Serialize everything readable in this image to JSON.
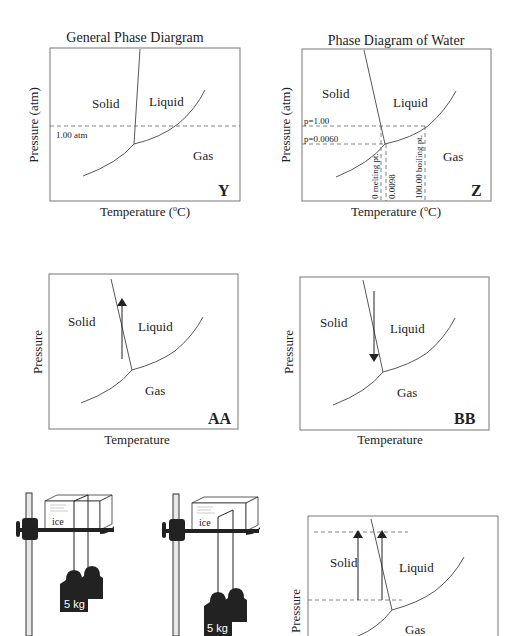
{
  "diagrams": {
    "y": {
      "title": "General Phase Diargram",
      "ylabel": "Pressure (atm)",
      "xlabel": "Temperature (",
      "xlabel_sup": "o",
      "xlabel_end": "C)",
      "regions": {
        "solid": "Solid",
        "liquid": "Liquid",
        "gas": "Gas"
      },
      "reference_line": "1.00 atm",
      "tag": "Y"
    },
    "z": {
      "title": "Phase Diagram of Water",
      "ylabel": "Pressure (atm)",
      "xlabel": "Temperature (",
      "xlabel_sup": "o",
      "xlabel_end": "C)",
      "regions": {
        "solid": "Solid",
        "liquid": "Liquid",
        "gas": "Gas"
      },
      "pressure_lines": [
        "p=1.00",
        "p=0.0060"
      ],
      "temperature_lines": [
        "0  melting pt.",
        "0.0098",
        "100.00  boiling pt."
      ],
      "tag": "Z"
    },
    "aa": {
      "ylabel": "Pressure",
      "xlabel": "Temperature",
      "regions": {
        "solid": "Solid",
        "liquid": "Liquid",
        "gas": "Gas"
      },
      "arrow_direction": "up",
      "tag": "AA"
    },
    "bb": {
      "ylabel": "Pressure",
      "xlabel": "Temperature",
      "regions": {
        "solid": "Solid",
        "liquid": "Liquid",
        "gas": "Gas"
      },
      "arrow_direction": "down",
      "tag": "BB"
    },
    "bottom_right": {
      "ylabel": "Pressure",
      "regions": {
        "solid": "Solid",
        "liquid": "Liquid",
        "gas": "Gas"
      },
      "arrows": 2
    }
  },
  "apparatus": [
    {
      "block_label": "ice",
      "weight_label": "5 kg",
      "state": "wire at top"
    },
    {
      "block_label": "ice",
      "weight_label": "5 kg",
      "state": "wire sunk into block"
    }
  ]
}
